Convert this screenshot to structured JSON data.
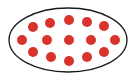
{
  "diagram": {
    "type": "set-of-dots",
    "ellipse": {
      "cx": 68,
      "cy": 40,
      "rx": 59,
      "ry": 32,
      "stroke": "#1a1a1a",
      "fill": "#ffffff"
    },
    "dot_color": "#d9342b",
    "dot_radius": 5,
    "dot_count": 15,
    "dots": [
      {
        "x": 33,
        "y": 27
      },
      {
        "x": 50,
        "y": 23
      },
      {
        "x": 69,
        "y": 20
      },
      {
        "x": 87,
        "y": 22
      },
      {
        "x": 104,
        "y": 26
      },
      {
        "x": 22,
        "y": 40
      },
      {
        "x": 47,
        "y": 40
      },
      {
        "x": 69,
        "y": 40
      },
      {
        "x": 91,
        "y": 40
      },
      {
        "x": 115,
        "y": 40
      },
      {
        "x": 33,
        "y": 52
      },
      {
        "x": 51,
        "y": 57
      },
      {
        "x": 69,
        "y": 61
      },
      {
        "x": 87,
        "y": 57
      },
      {
        "x": 104,
        "y": 52
      }
    ]
  }
}
